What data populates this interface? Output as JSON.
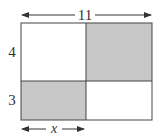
{
  "diagram": {
    "type": "rectangle-partition",
    "labels": {
      "total_width": "11",
      "top_height": "4",
      "bottom_height": "3",
      "bottom_left_width": "x"
    },
    "regions": [
      {
        "name": "top-left",
        "shaded": false
      },
      {
        "name": "top-right",
        "shaded": true
      },
      {
        "name": "bottom-left",
        "shaded": true
      },
      {
        "name": "bottom-right",
        "shaded": false
      }
    ],
    "colors": {
      "shade": "#c8c8c8",
      "stroke": "#444444",
      "background": "#ffffff"
    }
  }
}
